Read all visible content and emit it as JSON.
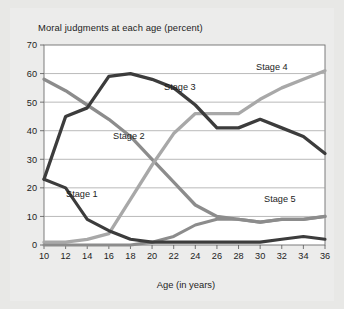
{
  "figure": {
    "background_color": "#e8e8e6",
    "plot_background_color": "#ffffff",
    "title": "Moral judgments at each age (percent)"
  },
  "axes": {
    "x_title": "Age (in years)",
    "y_title": "",
    "x_tick_labels": [
      "10",
      "12",
      "14",
      "16",
      "18",
      "20",
      "22",
      "24",
      "26",
      "28",
      "30",
      "32",
      "34",
      "36"
    ],
    "y_tick_labels": [
      "0",
      "10",
      "20",
      "30",
      "40",
      "50",
      "60",
      "70"
    ]
  },
  "series_labels": {
    "stage1": "Stage 1",
    "stage2": "Stage 2",
    "stage3": "Stage 3",
    "stage4": "Stage 4",
    "stage5": "Stage 5"
  },
  "colors": {
    "stage1": "#3c3c3c",
    "stage2": "#8c8c8c",
    "stage3": "#3c3c3c",
    "stage4": "#a8a8a8",
    "stage5": "#8c8c8c",
    "grid": "#9b9b9b",
    "border": "#6f6f6f",
    "text": "#1d1d1d"
  },
  "chart_data": {
    "type": "line",
    "title": "Moral judgments at each age (percent)",
    "xlabel": "Age (in years)",
    "ylabel": "",
    "xlim": [
      10,
      36
    ],
    "ylim": [
      0,
      70
    ],
    "grid": true,
    "legend_position": "inline-labels",
    "x": [
      10,
      12,
      14,
      16,
      18,
      20,
      22,
      24,
      26,
      28,
      30,
      32,
      34,
      36
    ],
    "series": [
      {
        "name": "Stage 1",
        "color": "#3c3c3c",
        "values": [
          23,
          20,
          9,
          5,
          2,
          1,
          1,
          1,
          1,
          1,
          1,
          2,
          3,
          2
        ]
      },
      {
        "name": "Stage 2",
        "color": "#8c8c8c",
        "values": [
          58,
          54,
          49,
          44,
          38,
          30,
          22,
          14,
          10,
          9,
          8,
          9,
          9,
          10
        ]
      },
      {
        "name": "Stage 3",
        "color": "#3c3c3c",
        "values": [
          23,
          45,
          48,
          59,
          60,
          58,
          55,
          49,
          41,
          41,
          44,
          41,
          38,
          32
        ]
      },
      {
        "name": "Stage 4",
        "color": "#a8a8a8",
        "values": [
          1,
          1,
          2,
          4,
          16,
          28,
          39,
          46,
          46,
          46,
          51,
          55,
          58,
          61
        ]
      },
      {
        "name": "Stage 5",
        "color": "#8c8c8c",
        "values": [
          0,
          0,
          0,
          0,
          0,
          1,
          3,
          7,
          9,
          9,
          8,
          9,
          9,
          10
        ]
      }
    ]
  }
}
